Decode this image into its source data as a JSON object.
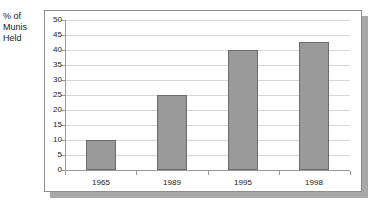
{
  "chart_data": {
    "type": "bar",
    "title": "",
    "subtitle": "",
    "xlabel": "",
    "ylabel": "% of\nMunis\nHeld",
    "categories": [
      "1965",
      "1989",
      "1995",
      "1998"
    ],
    "values": [
      10,
      25,
      40,
      42.5
    ],
    "series": [
      {
        "name": "% of Munis Held",
        "values": [
          10,
          25,
          40,
          42.5
        ]
      }
    ],
    "ylim": [
      0,
      50
    ],
    "ytick_labels": [
      "50",
      "45",
      "40",
      "35",
      "30",
      "25",
      "20",
      "15",
      "10",
      "5",
      "0"
    ],
    "ytick_values": [
      50,
      45,
      40,
      35,
      30,
      25,
      20,
      15,
      10,
      5,
      0
    ],
    "grid": true,
    "legend": false,
    "legend_position": "none",
    "colors": {
      "bar_fill": "#9a9a9a",
      "bar_border": "#6b6b6b",
      "gridline": "#d7d7d7",
      "axis": "#9a9a9a",
      "frame_border": "#8c8c8c",
      "frame_shadow": "#a8a8a8",
      "plot_background": "#ffffff",
      "text": "#1a1a1a"
    }
  }
}
